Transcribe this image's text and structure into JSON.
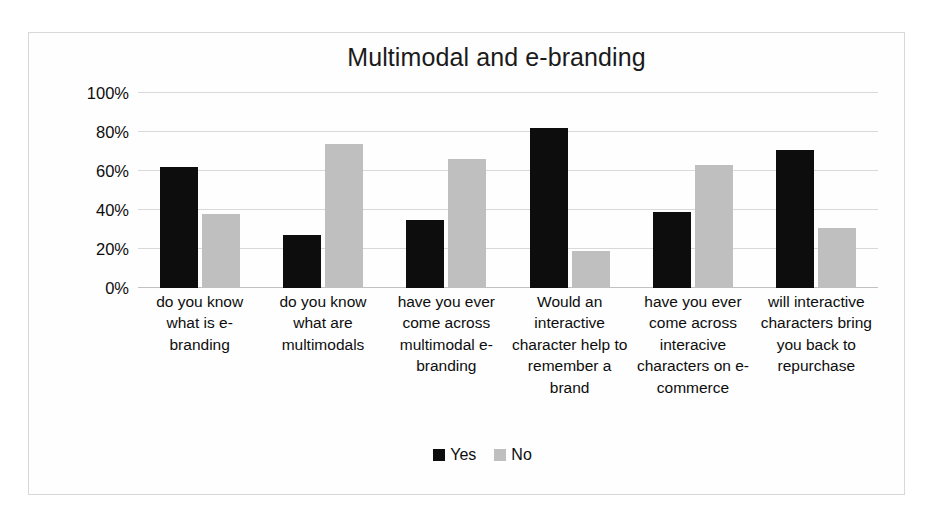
{
  "chart_data": {
    "type": "bar",
    "title": "Multimodal and e-branding",
    "xlabel": "",
    "ylabel": "",
    "ylim": [
      0,
      100
    ],
    "ytick_labels": [
      "100%",
      "80%",
      "60%",
      "40%",
      "20%",
      "0%"
    ],
    "ytick_values": [
      100,
      80,
      60,
      40,
      20,
      0
    ],
    "grid": true,
    "legend_position": "bottom",
    "categories": [
      "do you know what is e-branding",
      "do you know what are multimodals",
      "have you ever come across multimodal e-branding",
      "Would an interactive character help to remember a brand",
      "have you ever come across interacive characters on e-commerce",
      "will interactive characters bring you back to repurchase"
    ],
    "series": [
      {
        "name": "Yes",
        "color": "#0d0d0d",
        "values": [
          62,
          27,
          35,
          82,
          39,
          71
        ]
      },
      {
        "name": "No",
        "color": "#bfbfbf",
        "values": [
          38,
          74,
          66,
          19,
          63,
          31
        ]
      }
    ]
  },
  "legend": {
    "items": [
      {
        "label": "Yes",
        "swatch": "legend-swatch-yes"
      },
      {
        "label": "No",
        "swatch": "legend-swatch-no"
      }
    ]
  },
  "colors": {
    "yes": "#0d0d0d",
    "no": "#bfbfbf",
    "gridline": "#d9d9d9",
    "border": "#d8d8d8",
    "background": "#ffffff"
  }
}
